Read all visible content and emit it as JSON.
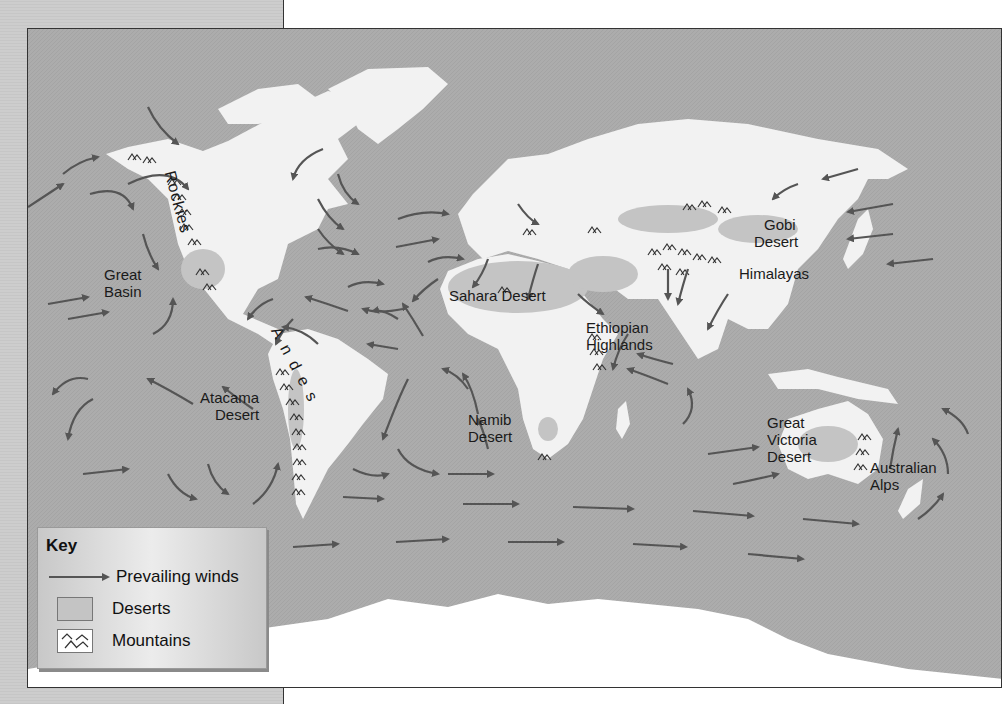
{
  "map": {
    "colors": {
      "ocean": "#a9a9a9",
      "land": "#f2f2f2",
      "desert": "#c4c4c4",
      "arrow": "#555555",
      "mountain": "#333333"
    },
    "labels": {
      "rockies": "Rockies",
      "great_basin": [
        "Great",
        "Basin"
      ],
      "andes": "Andes",
      "atacama": [
        "Atacama",
        "Desert"
      ],
      "sahara": "Sahara Desert",
      "namib": [
        "Namib",
        "Desert"
      ],
      "ethiopian": [
        "Ethiopian",
        "Highlands"
      ],
      "gobi": [
        "Gobi",
        "Desert"
      ],
      "himalayas": "Himalayas",
      "great_victoria": [
        "Great",
        "Victoria",
        "Desert"
      ],
      "australian_alps": [
        "Australian",
        "Alps"
      ]
    }
  },
  "key": {
    "title": "Key",
    "items": [
      {
        "symbol": "arrow",
        "label": "Prevailing winds"
      },
      {
        "symbol": "desert-swatch",
        "label": "Deserts"
      },
      {
        "symbol": "mountain-icon",
        "label": "Mountains"
      }
    ]
  }
}
